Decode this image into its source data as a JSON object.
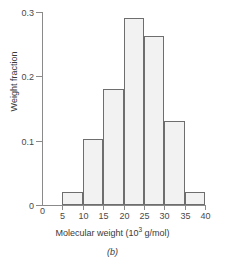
{
  "figure": {
    "caption": "(b)",
    "y_axis_title": "Weight fraction",
    "x_axis_title_main": "Molecular weight (10",
    "x_axis_title_exponent": "3",
    "x_axis_title_tail": " g/mol)"
  },
  "chart_data": {
    "type": "bar",
    "title": "",
    "subtitle": "",
    "xlabel": "Molecular weight (10^3 g/mol)",
    "ylabel": "Weight fraction",
    "xlim": [
      0,
      40
    ],
    "ylim": [
      0,
      0.3
    ],
    "grid": false,
    "legend": "none",
    "bin_width": 5,
    "bin_edges": [
      5,
      10,
      15,
      20,
      25,
      30,
      35,
      40
    ],
    "categories": [
      "5-10",
      "10-15",
      "15-20",
      "20-25",
      "25-30",
      "30-35",
      "35-40"
    ],
    "values": [
      0.02,
      0.103,
      0.18,
      0.29,
      0.262,
      0.13,
      0.02
    ],
    "bars": [
      {
        "label": "5-10",
        "x0": 5,
        "x1": 10,
        "value": 0.02
      },
      {
        "label": "10-15",
        "x0": 10,
        "x1": 15,
        "value": 0.103
      },
      {
        "label": "15-20",
        "x0": 15,
        "x1": 20,
        "value": 0.18
      },
      {
        "label": "20-25",
        "x0": 20,
        "x1": 25,
        "value": 0.29
      },
      {
        "label": "25-30",
        "x0": 25,
        "x1": 30,
        "value": 0.262
      },
      {
        "label": "30-35",
        "x0": 30,
        "x1": 35,
        "value": 0.13
      },
      {
        "label": "35-40",
        "x0": 35,
        "x1": 40,
        "value": 0.02
      }
    ],
    "x_ticks": [
      {
        "value": 0,
        "label": "0"
      },
      {
        "value": 5,
        "label": "5"
      },
      {
        "value": 10,
        "label": "10"
      },
      {
        "value": 15,
        "label": "15"
      },
      {
        "value": 20,
        "label": "20"
      },
      {
        "value": 25,
        "label": "25"
      },
      {
        "value": 30,
        "label": "30"
      },
      {
        "value": 35,
        "label": "35"
      },
      {
        "value": 40,
        "label": "40"
      }
    ],
    "y_ticks": [
      {
        "value": 0,
        "label": "0"
      },
      {
        "value": 0.1,
        "label": "0.1"
      },
      {
        "value": 0.2,
        "label": "0.2"
      },
      {
        "value": 0.3,
        "label": "0.3"
      }
    ],
    "colors": {
      "bar_fill": "#f2f2f2",
      "bar_stroke": "#6e6e6e",
      "axis": "#8a8a8a",
      "text": "#3a3a3a",
      "background": "#ffffff"
    }
  }
}
